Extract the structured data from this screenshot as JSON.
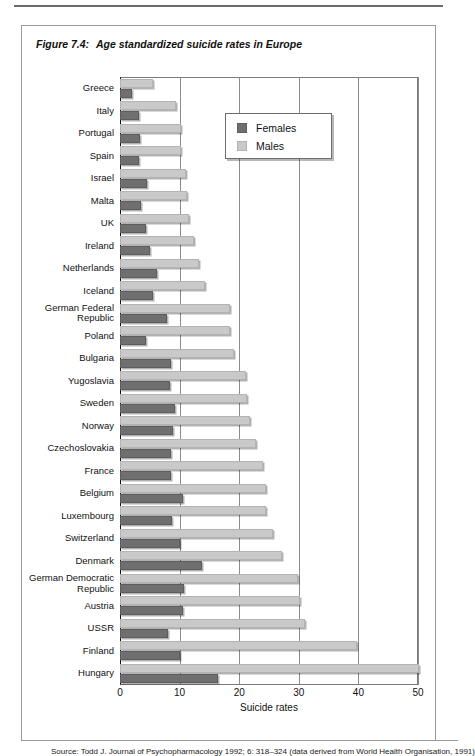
{
  "figure": {
    "number_label": "Figure 7.4:",
    "caption": "Age standardized suicide rates in Europe",
    "source": "Source: Todd J. Journal of Psychopharmacology 1992; 6: 318–324 (data derived from World Health Organisation, 1991)"
  },
  "legend": {
    "position": "inside-top-right",
    "entries": [
      {
        "label": "Females",
        "color": "#6f6f6f"
      },
      {
        "label": "Males",
        "color": "#c9c9c9"
      }
    ]
  },
  "colors": {
    "females": "#6f6f6f",
    "males": "#c9c9c9",
    "frame": "#7a7a7a",
    "grid": "#8c8c8c",
    "box_border": "#9a9a9a"
  },
  "chart_data": {
    "type": "bar",
    "orientation": "horizontal",
    "title": "Age standardized suicide rates in Europe",
    "xlabel": "Suicide rates",
    "ylabel": "",
    "xlim": [
      0,
      50
    ],
    "xticks": [
      0,
      10,
      20,
      30,
      40,
      50
    ],
    "xtick_labels": [
      "0",
      "10",
      "20",
      "30",
      "40",
      "50"
    ],
    "grid": "vertical",
    "legend": [
      "Females",
      "Males"
    ],
    "categories": [
      "Greece",
      "Italy",
      "Portugal",
      "Spain",
      "Israel",
      "Malta",
      "UK",
      "Ireland",
      "Netherlands",
      "Iceland",
      "German Federal\nRepublic",
      "Poland",
      "Bulgaria",
      "Yugoslavia",
      "Sweden",
      "Norway",
      "Czechoslovakia",
      "France",
      "Belgium",
      "Luxembourg",
      "Switzerland",
      "Denmark",
      "German Democratic\nRepublic",
      "Austria",
      "USSR",
      "Finland",
      "Hungary"
    ],
    "series": [
      {
        "name": "Males",
        "color": "#c9c9c9",
        "values": [
          5.5,
          9.4,
          10.3,
          10.3,
          11.0,
          11.3,
          11.5,
          12.4,
          13.2,
          14.2,
          18.5,
          18.5,
          19.2,
          21.2,
          21.3,
          21.8,
          22.8,
          24.0,
          24.5,
          24.5,
          25.6,
          27.2,
          29.8,
          30.2,
          31.0,
          39.8,
          50.2
        ]
      },
      {
        "name": "Females",
        "color": "#6f6f6f",
        "values": [
          2.0,
          3.2,
          3.4,
          3.2,
          4.6,
          3.6,
          4.3,
          5.1,
          6.2,
          5.5,
          7.9,
          4.4,
          8.6,
          8.4,
          9.3,
          8.9,
          8.6,
          8.5,
          10.5,
          8.7,
          10.1,
          13.8,
          10.8,
          10.6,
          8.0,
          10.1,
          16.5
        ]
      }
    ]
  }
}
